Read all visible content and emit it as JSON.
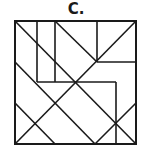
{
  "figure": {
    "label": "C.",
    "stroke_color": "#1a1a1a",
    "background": "#ffffff",
    "square": {
      "x1": 15,
      "y1": 21,
      "x2": 136,
      "y2": 144
    },
    "segments": [
      {
        "x1": 37,
        "y1": 21,
        "x2": 37,
        "y2": 82
      },
      {
        "x1": 55,
        "y1": 21,
        "x2": 55,
        "y2": 82
      },
      {
        "x1": 97,
        "y1": 21,
        "x2": 97,
        "y2": 62
      },
      {
        "x1": 97,
        "y1": 62,
        "x2": 136,
        "y2": 62
      },
      {
        "x1": 37,
        "y1": 82,
        "x2": 116,
        "y2": 82
      },
      {
        "x1": 116,
        "y1": 82,
        "x2": 116,
        "y2": 144
      },
      {
        "x1": 15,
        "y1": 21,
        "x2": 136,
        "y2": 144
      },
      {
        "x1": 55,
        "y1": 21,
        "x2": 97,
        "y2": 62
      },
      {
        "x1": 136,
        "y1": 21,
        "x2": 15,
        "y2": 144
      },
      {
        "x1": 15,
        "y1": 62,
        "x2": 95,
        "y2": 144
      },
      {
        "x1": 15,
        "y1": 103,
        "x2": 55,
        "y2": 144
      },
      {
        "x1": 95,
        "y1": 144,
        "x2": 136,
        "y2": 103
      }
    ]
  }
}
